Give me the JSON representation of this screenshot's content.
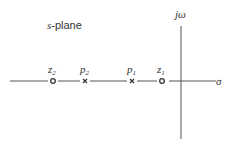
{
  "title": "s-plane",
  "title_prefix": "s",
  "title_suffix": "-plane",
  "axes": {
    "real_label": "σ",
    "imag_label": "jω"
  },
  "markers": [
    {
      "name": "z2",
      "type": "zero",
      "label_base": "z",
      "label_sub": "2",
      "x": 53
    },
    {
      "name": "p2",
      "type": "pole",
      "label_base": "p",
      "label_sub": "2",
      "x": 85
    },
    {
      "name": "p1",
      "type": "pole",
      "label_base": "p",
      "label_sub": "1",
      "x": 132
    },
    {
      "name": "z1",
      "type": "zero",
      "label_base": "z",
      "label_sub": "1",
      "x": 162
    }
  ],
  "colors": {
    "line": "#555555",
    "text": "#333333"
  }
}
